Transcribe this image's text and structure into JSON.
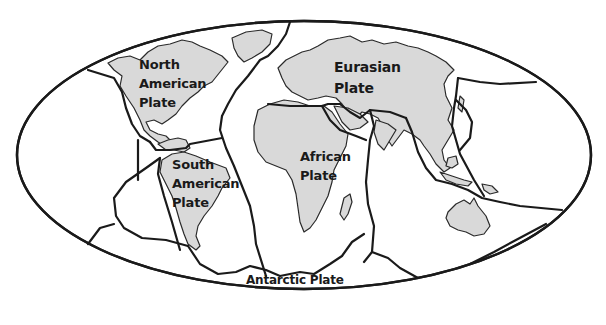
{
  "diagram": {
    "type": "world-map-tectonic-plates",
    "colors": {
      "background": "#ffffff",
      "land": "#d9d9d9",
      "lines": "#1a1a1a"
    },
    "plates": [
      {
        "id": "north-american",
        "label": "North\nAmerican\nPlate"
      },
      {
        "id": "eurasian",
        "label": "Eurasian\nPlate"
      },
      {
        "id": "south-american",
        "label": "South\nAmerican\nPlate"
      },
      {
        "id": "african",
        "label": "African\nPlate"
      },
      {
        "id": "antarctic",
        "label": "Antarctic Plate"
      }
    ]
  }
}
